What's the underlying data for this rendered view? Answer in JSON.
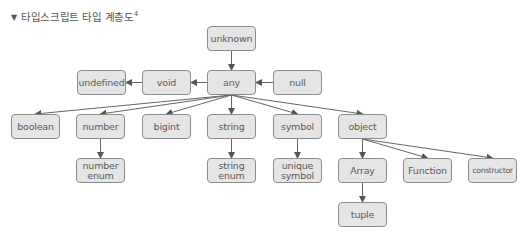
{
  "title": {
    "marker": "▼",
    "text": "타입스크립트 타입 계층도",
    "superscript": "4"
  },
  "nodes": [
    {
      "id": "unknown",
      "label": "unknown",
      "x": 207,
      "y": 26
    },
    {
      "id": "undefined",
      "label": "undefined",
      "x": 77,
      "y": 70
    },
    {
      "id": "void",
      "label": "void",
      "x": 142,
      "y": 70
    },
    {
      "id": "any",
      "label": "any",
      "x": 207,
      "y": 70
    },
    {
      "id": "null",
      "label": "null",
      "x": 273,
      "y": 70
    },
    {
      "id": "boolean",
      "label": "boolean",
      "x": 11,
      "y": 114
    },
    {
      "id": "number",
      "label": "number",
      "x": 76,
      "y": 114
    },
    {
      "id": "bigint",
      "label": "bigint",
      "x": 142,
      "y": 114
    },
    {
      "id": "string",
      "label": "string",
      "x": 207,
      "y": 114
    },
    {
      "id": "symbol",
      "label": "symbol",
      "x": 273,
      "y": 114
    },
    {
      "id": "object",
      "label": "object",
      "x": 338,
      "y": 114
    },
    {
      "id": "number_enum",
      "label": "number\nenum",
      "x": 76,
      "y": 158
    },
    {
      "id": "string_enum",
      "label": "string\nenum",
      "x": 207,
      "y": 158
    },
    {
      "id": "unique_symbol",
      "label": "unique\nsymbol",
      "x": 273,
      "y": 158
    },
    {
      "id": "array",
      "label": "Array",
      "x": 338,
      "y": 158
    },
    {
      "id": "function",
      "label": "Function",
      "x": 403,
      "y": 158
    },
    {
      "id": "constructor",
      "label": "constructor",
      "x": 468,
      "y": 158
    },
    {
      "id": "tuple",
      "label": "tuple",
      "x": 338,
      "y": 202
    }
  ],
  "edges": [
    {
      "from": "unknown",
      "to": "any"
    },
    {
      "from": "null",
      "to": "any"
    },
    {
      "from": "any",
      "to": "void"
    },
    {
      "from": "void",
      "to": "undefined"
    },
    {
      "from": "any",
      "to": "boolean"
    },
    {
      "from": "any",
      "to": "number"
    },
    {
      "from": "any",
      "to": "bigint"
    },
    {
      "from": "any",
      "to": "string"
    },
    {
      "from": "any",
      "to": "symbol"
    },
    {
      "from": "any",
      "to": "object"
    },
    {
      "from": "number",
      "to": "number_enum"
    },
    {
      "from": "string",
      "to": "string_enum"
    },
    {
      "from": "symbol",
      "to": "unique_symbol"
    },
    {
      "from": "object",
      "to": "array"
    },
    {
      "from": "object",
      "to": "function"
    },
    {
      "from": "object",
      "to": "constructor"
    },
    {
      "from": "array",
      "to": "tuple"
    }
  ],
  "colors": {
    "node_fill": "#e5e5e5",
    "node_border": "#8c8c8c",
    "text": "#5a5a5a",
    "edge": "#555555"
  }
}
